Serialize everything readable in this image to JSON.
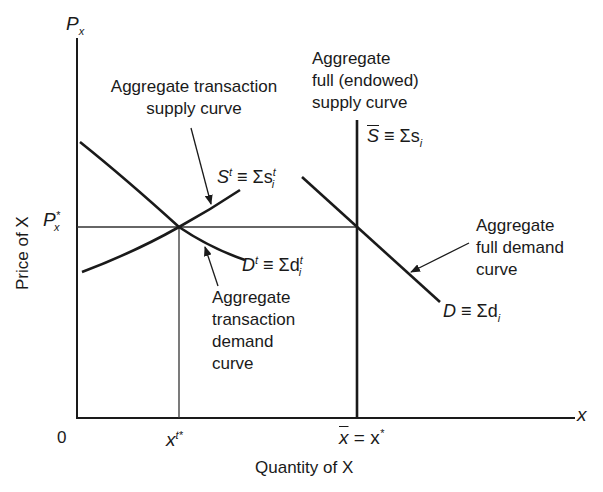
{
  "diagram": {
    "axes": {
      "y_axis_symbol": "P",
      "y_axis_symbol_sub": "x",
      "x_axis_symbol": "x",
      "y_axis_label": "Price of X",
      "x_axis_label": "Quantity of X",
      "origin_label": "0"
    },
    "ticks": {
      "price_eq_base": "P",
      "price_eq_sup": "*",
      "price_eq_sub": "x",
      "qty_transaction_base": "x",
      "qty_transaction_sup": "t*",
      "qty_full_bar": "x",
      "qty_full_rest": " = x",
      "qty_full_sup": "*"
    },
    "annotations": {
      "transaction_supply": [
        "Aggregate transaction",
        "supply curve"
      ],
      "full_supply": [
        "Aggregate",
        "full (endowed)",
        "supply curve"
      ],
      "full_demand": [
        "Aggregate",
        "full demand",
        "curve"
      ],
      "transaction_demand": [
        "Aggregate",
        "transaction",
        "demand",
        "curve"
      ]
    },
    "curve_labels": {
      "st": {
        "base": "S",
        "sup": "t",
        "eq": " ≡ Σs",
        "sub": "i",
        "sup2": "t"
      },
      "dt": {
        "base": "D",
        "sup": "t",
        "eq": " ≡ Σd",
        "sub": "i",
        "sup2": "t"
      },
      "sbar": {
        "base": "S",
        "eq": " ≡ Σs",
        "sub": "i"
      },
      "d": {
        "base": "D",
        "eq": " ≡ Σd",
        "sub": "i"
      }
    },
    "geometry": {
      "y_axis": {
        "x": 77,
        "y1": 38,
        "y2": 418
      },
      "x_axis": {
        "y": 418,
        "x1": 77,
        "x2": 575
      },
      "price_line": {
        "y": 227,
        "x1": 77,
        "x2": 357
      },
      "transaction_qty_line": {
        "x": 179,
        "y1": 227,
        "y2": 418
      },
      "full_supply_line": {
        "x": 357,
        "y1": 120,
        "y2": 418
      },
      "transaction_demand": [
        [
          80,
          142
        ],
        [
          130,
          184
        ],
        [
          179,
          227
        ],
        [
          245,
          260
        ]
      ],
      "transaction_supply": [
        [
          82,
          272
        ],
        [
          130,
          248
        ],
        [
          179,
          227
        ],
        [
          240,
          190
        ]
      ],
      "full_demand": [
        [
          302,
          177
        ],
        [
          357,
          227
        ],
        [
          440,
          302
        ]
      ]
    },
    "colors": {
      "ink": "#1a1a1a",
      "background": "#ffffff"
    }
  }
}
